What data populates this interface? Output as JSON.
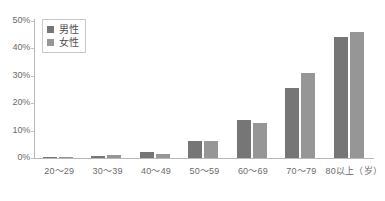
{
  "chart_data": {
    "type": "bar",
    "title": "",
    "subtitle": "",
    "xlabel": "",
    "ylabel": "",
    "categories": [
      "20～29",
      "30～39",
      "40～49",
      "50～59",
      "60～69",
      "70～79",
      "80以上（岁）"
    ],
    "series": [
      {
        "name": "男性",
        "color": "#767676",
        "values": [
          0.3,
          0.8,
          2.2,
          6.2,
          14.0,
          25.5,
          44.0
        ]
      },
      {
        "name": "女性",
        "color": "#969696",
        "values": [
          0.2,
          1.0,
          1.5,
          6.2,
          12.8,
          31.0,
          46.0
        ]
      }
    ],
    "ylim": [
      0,
      50
    ],
    "yticks": [
      "0%",
      "10%",
      "20%",
      "30%",
      "40%",
      "50%"
    ],
    "ytick_values": [
      0,
      10,
      20,
      30,
      40,
      50
    ],
    "grid": false,
    "legend_position": "top-left",
    "value_unit": "%"
  },
  "legend": {
    "items": [
      {
        "label": "男性",
        "color": "#767676"
      },
      {
        "label": "女性",
        "color": "#969696"
      }
    ]
  },
  "caption": {
    "text": ""
  }
}
